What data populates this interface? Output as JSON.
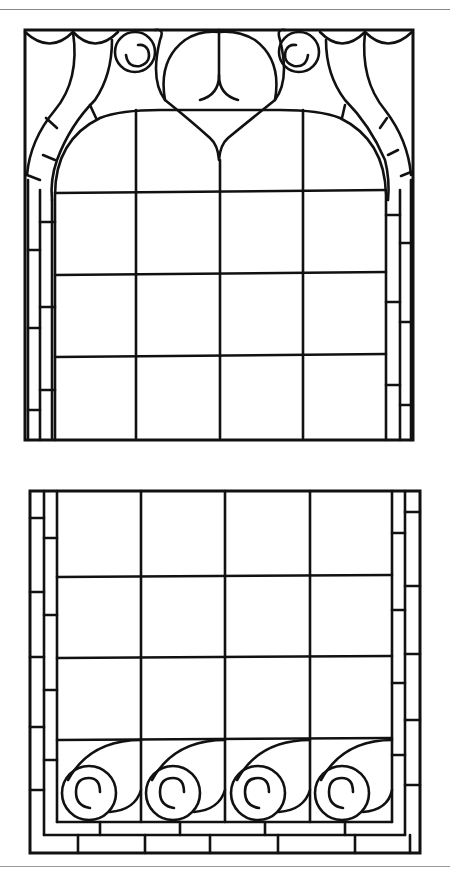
{
  "page": {
    "header_text": "·····  ·  ·····"
  },
  "top_panel": {
    "name": "arched-window-panel",
    "grid": {
      "columns": 4,
      "rows": 3
    },
    "roundels": 2,
    "border_segments": "bricked side borders"
  },
  "bottom_panel": {
    "name": "scroll-border-panel",
    "grid": {
      "columns": 4,
      "rows": 3
    },
    "scrolls": 4,
    "border_segments": "bricked side and base borders"
  },
  "colors": {
    "line": "#111111",
    "background": "#ffffff",
    "rule": "#888888"
  }
}
